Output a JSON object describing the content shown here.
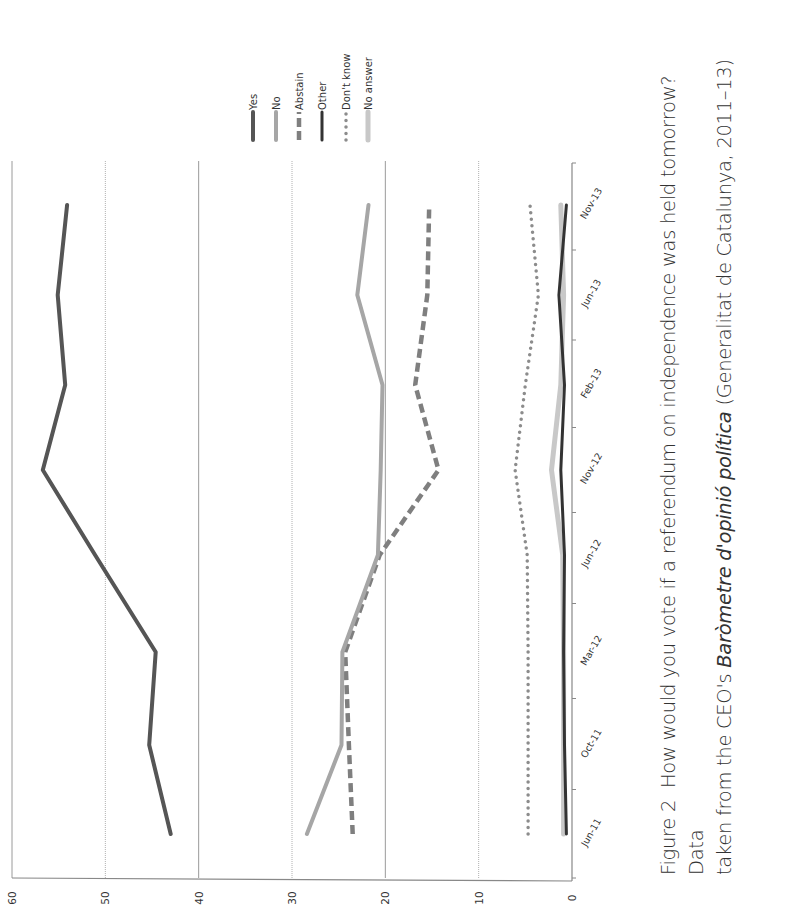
{
  "caption": {
    "figure_label": "Figure 2",
    "line1_text": "How would you vote if a referendum on independence was held tomorrow? Data",
    "line2_prefix": "taken from the CEO's ",
    "line2_italic": "Baròmetre d'opinió política",
    "line2_suffix": " (Generalitat de Catalunya, 2011–13)"
  },
  "chart_data": {
    "type": "line",
    "orientation": "rotated 90° counter-clockwise on page",
    "title": "How would you vote if a referendum on independence was held tomorrow?",
    "xlabel": "",
    "ylabel": "",
    "categories": [
      "Jun-11",
      "Oct-11",
      "Mar-12",
      "Jun-12",
      "Nov-12",
      "Feb-13",
      "Jun-13",
      "Nov-13"
    ],
    "y_ticks": [
      0,
      10,
      20,
      30,
      40,
      50,
      60
    ],
    "ylim": [
      0,
      60
    ],
    "grid": true,
    "legend_position": "right (top of rotated page)",
    "series": [
      {
        "name": "Yes",
        "style": "solid",
        "color": "#555555",
        "values": [
          43.0,
          45.3,
          44.6,
          51.1,
          56.7,
          54.3,
          55.1,
          54.1
        ]
      },
      {
        "name": "No",
        "style": "solid",
        "color": "#a6a6a6",
        "values": [
          28.4,
          24.7,
          24.6,
          20.8,
          20.5,
          20.3,
          23.0,
          21.8
        ]
      },
      {
        "name": "Abstain",
        "style": "dashed",
        "color": "#7f7f7f",
        "values": [
          23.5,
          23.9,
          24.3,
          20.6,
          14.3,
          16.8,
          15.5,
          15.3
        ]
      },
      {
        "name": "Other",
        "style": "solid",
        "color": "#333333",
        "values": [
          0.6,
          0.8,
          0.9,
          0.8,
          1.2,
          0.8,
          1.4,
          0.6
        ]
      },
      {
        "name": "Don't know",
        "style": "dotted",
        "color": "#8c8c8c",
        "values": [
          4.7,
          4.7,
          4.7,
          4.8,
          6.1,
          5.0,
          3.6,
          4.5
        ]
      },
      {
        "name": "No answer",
        "style": "solid",
        "color": "#c8c8c8",
        "values": [
          0.9,
          0.9,
          0.9,
          1.0,
          2.2,
          1.2,
          0.9,
          1.2
        ]
      }
    ]
  }
}
